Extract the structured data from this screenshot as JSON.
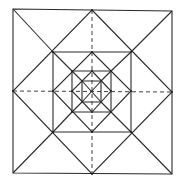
{
  "diagram": {
    "type": "nested-squares-and-diamonds",
    "colors": {
      "line": "#2a2a2a",
      "background": "#ffffff"
    },
    "outer_square": {
      "x1": 13,
      "y1": 9,
      "x2": 172,
      "y2": 174
    },
    "center": {
      "x": 92,
      "y": 91
    },
    "levels": 6
  }
}
